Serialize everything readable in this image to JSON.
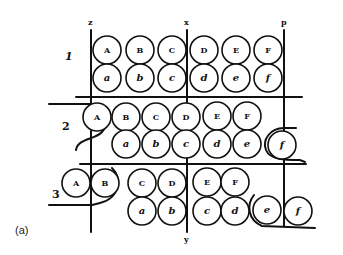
{
  "caption": "(a)",
  "axis_labels": {
    "z": "z",
    "x": "x",
    "p": "p",
    "y": "y"
  },
  "row_labels": [
    "1",
    "2",
    "3"
  ],
  "colors": {
    "ink": "#111111",
    "background": "#ffffff"
  },
  "rows": [
    {
      "label": "1",
      "upper": [
        {
          "t": "A",
          "cx": 107,
          "cy": 50
        },
        {
          "t": "B",
          "cx": 140,
          "cy": 50
        },
        {
          "t": "C",
          "cx": 172,
          "cy": 50
        },
        {
          "t": "D",
          "cx": 204,
          "cy": 50
        },
        {
          "t": "E",
          "cx": 236,
          "cy": 50
        },
        {
          "t": "F",
          "cx": 268,
          "cy": 50
        }
      ],
      "lower": [
        {
          "t": "a",
          "cx": 107,
          "cy": 78
        },
        {
          "t": "b",
          "cx": 140,
          "cy": 78
        },
        {
          "t": "c",
          "cx": 172,
          "cy": 78
        },
        {
          "t": "d",
          "cx": 204,
          "cy": 78
        },
        {
          "t": "e",
          "cx": 236,
          "cy": 78
        },
        {
          "t": "f",
          "cx": 268,
          "cy": 78
        }
      ]
    },
    {
      "label": "2",
      "upper": [
        {
          "t": "A",
          "cx": 97,
          "cy": 117
        },
        {
          "t": "B",
          "cx": 126,
          "cy": 117
        },
        {
          "t": "C",
          "cx": 156,
          "cy": 117
        },
        {
          "t": "D",
          "cx": 186,
          "cy": 117
        },
        {
          "t": "E",
          "cx": 217,
          "cy": 116
        },
        {
          "t": "F",
          "cx": 247,
          "cy": 116
        }
      ],
      "lower": [
        {
          "t": "a",
          "cx": 126,
          "cy": 144
        },
        {
          "t": "b",
          "cx": 156,
          "cy": 144
        },
        {
          "t": "c",
          "cx": 186,
          "cy": 144
        },
        {
          "t": "d",
          "cx": 217,
          "cy": 144
        },
        {
          "t": "e",
          "cx": 247,
          "cy": 144
        },
        {
          "t": "f",
          "cx": 282,
          "cy": 145
        }
      ]
    },
    {
      "label": "3",
      "upper": [
        {
          "t": "A",
          "cx": 76,
          "cy": 183
        },
        {
          "t": "B",
          "cx": 105,
          "cy": 183
        },
        {
          "t": "C",
          "cx": 142,
          "cy": 183
        },
        {
          "t": "D",
          "cx": 172,
          "cy": 183
        },
        {
          "t": "E",
          "cx": 207,
          "cy": 182
        },
        {
          "t": "F",
          "cx": 235,
          "cy": 182
        }
      ],
      "lower": [
        {
          "t": "a",
          "cx": 142,
          "cy": 211
        },
        {
          "t": "b",
          "cx": 172,
          "cy": 211
        },
        {
          "t": "c",
          "cx": 207,
          "cy": 211
        },
        {
          "t": "d",
          "cx": 235,
          "cy": 211
        },
        {
          "t": "e",
          "cx": 267,
          "cy": 210
        },
        {
          "t": "f",
          "cx": 298,
          "cy": 211
        }
      ]
    }
  ]
}
